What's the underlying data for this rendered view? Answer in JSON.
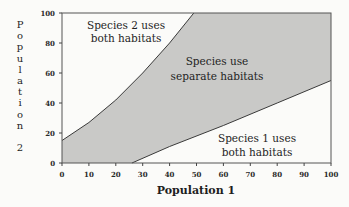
{
  "chart_data": {
    "type": "area",
    "title": "",
    "xlabel": "Population 1",
    "ylabel": "Population 2",
    "xlim": [
      0,
      100
    ],
    "ylim": [
      0,
      100
    ],
    "x_ticks": [
      0,
      10,
      20,
      30,
      40,
      50,
      60,
      70,
      80,
      90,
      100
    ],
    "y_ticks": [
      0,
      20,
      40,
      60,
      80,
      100
    ],
    "grid": false,
    "legend": null,
    "series": [
      {
        "name": "Upper boundary (Species 2 uses both habitats above)",
        "x": [
          0,
          10,
          20,
          30,
          40,
          49
        ],
        "y": [
          15,
          27,
          42,
          60,
          80,
          100
        ]
      },
      {
        "name": "Lower boundary (Species 1 uses both habitats below)",
        "x": [
          26,
          40,
          60,
          80,
          100
        ],
        "y": [
          0,
          11,
          25,
          40,
          55
        ]
      }
    ],
    "shaded_region": "Species use separate habitats (between boundaries)",
    "annotations": [
      {
        "text": "Species 2 uses both habitats",
        "region": "upper-left"
      },
      {
        "text": "Species use separate habitats",
        "region": "center (shaded)"
      },
      {
        "text": "Species 1 uses both habitats",
        "region": "lower-right"
      }
    ]
  },
  "labels": {
    "region_top_line1": "Species 2 uses",
    "region_top_line2": "both habitats",
    "region_mid_line1": "Species use",
    "region_mid_line2": "separate habitats",
    "region_bot_line1": "Species 1 uses",
    "region_bot_line2": "both habitats",
    "xlabel": "Population 1",
    "ylabel_letters": [
      "P",
      "o",
      "p",
      "u",
      "l",
      "a",
      "t",
      "i",
      "o",
      "n",
      "",
      "2"
    ]
  },
  "colors": {
    "shade": "#c9c9c7",
    "line": "#3a3a3a",
    "background": "#fbfbf9"
  }
}
